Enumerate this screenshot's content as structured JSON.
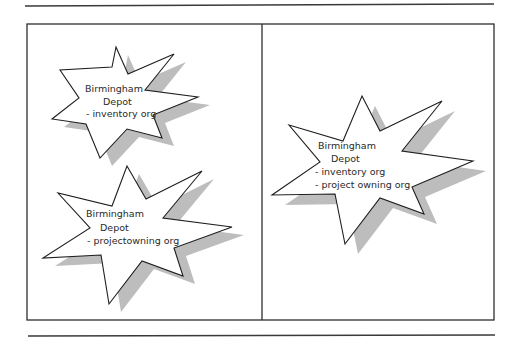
{
  "diagram": {
    "colors": {
      "rule": "#3a3a3a",
      "frame": "#2e2e2e",
      "star_fill": "#ffffff",
      "star_stroke": "#1e1e1e",
      "shadow": "#bdbdbd",
      "text": "#2a2a2a"
    },
    "panels": [
      {
        "id": "left",
        "stars": [
          {
            "id": "star-1",
            "lines": [
              "Birmingham",
              "Depot",
              "- inventory org"
            ]
          },
          {
            "id": "star-2",
            "lines": [
              "Birmingham",
              "Depot",
              "- projectowning org"
            ]
          }
        ]
      },
      {
        "id": "right",
        "stars": [
          {
            "id": "star-3",
            "lines": [
              "Birmingham",
              "Depot",
              "- inventory org",
              "- project owning org"
            ]
          }
        ]
      }
    ]
  }
}
